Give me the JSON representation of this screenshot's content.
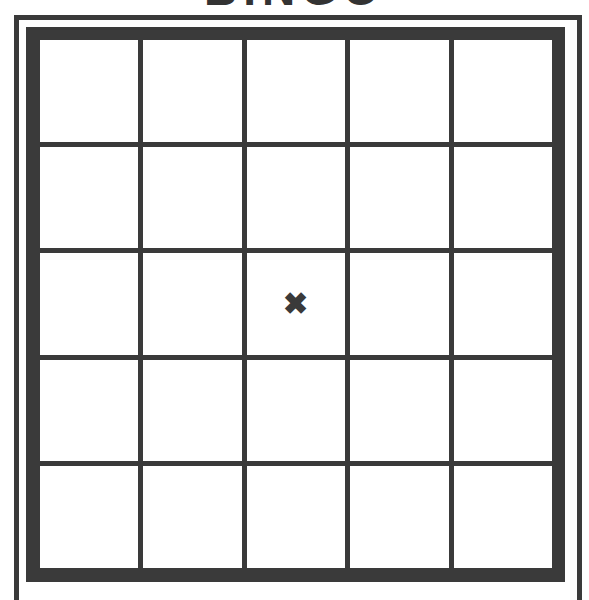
{
  "title": "BINGO",
  "colors": {
    "line": "#3a3a3a",
    "background": "#ffffff"
  },
  "board": {
    "rows": 5,
    "cols": 5,
    "cells": [
      [
        "",
        "",
        "",
        "",
        ""
      ],
      [
        "",
        "",
        "",
        "",
        ""
      ],
      [
        "",
        "",
        "✖",
        "",
        ""
      ],
      [
        "",
        "",
        "",
        "",
        ""
      ],
      [
        "",
        "",
        "",
        "",
        ""
      ]
    ],
    "free_space_icon": "x-mark-icon"
  }
}
